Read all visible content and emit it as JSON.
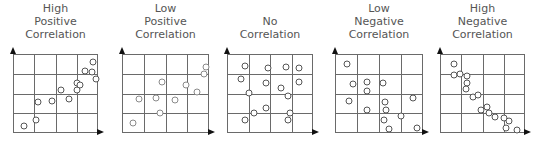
{
  "panels": [
    {
      "title_lines": [
        "High",
        "Positive",
        "Correlation"
      ],
      "point_color": "#555555",
      "points": [
        [
          0.12,
          0.9
        ],
        [
          0.26,
          0.82
        ],
        [
          0.28,
          0.6
        ],
        [
          0.45,
          0.58
        ],
        [
          0.55,
          0.44
        ],
        [
          0.65,
          0.56
        ],
        [
          0.74,
          0.35
        ],
        [
          0.74,
          0.44
        ],
        [
          0.83,
          0.2
        ],
        [
          0.93,
          0.09
        ],
        [
          0.92,
          0.21
        ],
        [
          0.96,
          0.3
        ],
        [
          0.78,
          0.38
        ]
      ]
    },
    {
      "title_lines": [
        "Low",
        "Positive",
        "Correlation"
      ],
      "point_color": "#8a8a8a",
      "points": [
        [
          0.12,
          0.86
        ],
        [
          0.18,
          0.56
        ],
        [
          0.38,
          0.55
        ],
        [
          0.45,
          0.34
        ],
        [
          0.6,
          0.57
        ],
        [
          0.72,
          0.38
        ],
        [
          0.95,
          0.15
        ],
        [
          0.93,
          0.24
        ],
        [
          0.85,
          0.47
        ],
        [
          0.43,
          0.74
        ]
      ]
    },
    {
      "title_lines": [
        "No",
        "Correlation"
      ],
      "point_color": "#555555",
      "points": [
        [
          0.2,
          0.14
        ],
        [
          0.47,
          0.16
        ],
        [
          0.68,
          0.15
        ],
        [
          0.82,
          0.16
        ],
        [
          0.15,
          0.31
        ],
        [
          0.44,
          0.36
        ],
        [
          0.62,
          0.42
        ],
        [
          0.83,
          0.34
        ],
        [
          0.24,
          0.48
        ],
        [
          0.7,
          0.52
        ],
        [
          0.44,
          0.67
        ],
        [
          0.3,
          0.74
        ],
        [
          0.72,
          0.74
        ],
        [
          0.2,
          0.82
        ],
        [
          0.7,
          0.82
        ]
      ]
    },
    {
      "title_lines": [
        "Low",
        "Negative",
        "Correlation"
      ],
      "point_color": "#555555",
      "points": [
        [
          0.12,
          0.12
        ],
        [
          0.19,
          0.37
        ],
        [
          0.35,
          0.34
        ],
        [
          0.53,
          0.35
        ],
        [
          0.35,
          0.45
        ],
        [
          0.15,
          0.58
        ],
        [
          0.56,
          0.6
        ],
        [
          0.35,
          0.69
        ],
        [
          0.57,
          0.69
        ],
        [
          0.87,
          0.55
        ],
        [
          0.54,
          0.82
        ],
        [
          0.74,
          0.77
        ],
        [
          0.6,
          0.94
        ],
        [
          0.92,
          0.92
        ]
      ]
    },
    {
      "title_lines": [
        "High",
        "Negative",
        "Correlation"
      ],
      "point_color": "#555555",
      "points": [
        [
          0.15,
          0.12
        ],
        [
          0.15,
          0.25
        ],
        [
          0.22,
          0.24
        ],
        [
          0.3,
          0.26
        ],
        [
          0.31,
          0.35
        ],
        [
          0.29,
          0.43
        ],
        [
          0.38,
          0.53
        ],
        [
          0.44,
          0.5
        ],
        [
          0.47,
          0.69
        ],
        [
          0.54,
          0.66
        ],
        [
          0.56,
          0.73
        ],
        [
          0.63,
          0.78
        ],
        [
          0.74,
          0.8
        ],
        [
          0.8,
          0.83
        ],
        [
          0.77,
          0.93
        ],
        [
          0.89,
          0.95
        ]
      ]
    }
  ]
}
